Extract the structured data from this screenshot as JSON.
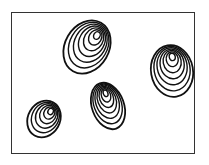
{
  "illustration": {
    "description": "Line drawing of four egg-shaped seeds with concentric ring patterns inside a rectangular frame",
    "stroke_color": "#111111",
    "background": "#ffffff",
    "frame_color": "#333333",
    "seeds": [
      {
        "name": "seed-top-center",
        "cx": 87,
        "cy": 47,
        "rx": 22,
        "ry": 28,
        "rotate": 30,
        "rings": 7
      },
      {
        "name": "seed-right",
        "cx": 172,
        "cy": 71,
        "rx": 21,
        "ry": 26,
        "rotate": -10,
        "rings": 7
      },
      {
        "name": "seed-center-bottom",
        "cx": 108,
        "cy": 106,
        "rx": 16,
        "ry": 24,
        "rotate": -20,
        "rings": 7
      },
      {
        "name": "seed-bottom-left",
        "cx": 44,
        "cy": 119,
        "rx": 16,
        "ry": 19,
        "rotate": 30,
        "rings": 6
      }
    ]
  }
}
